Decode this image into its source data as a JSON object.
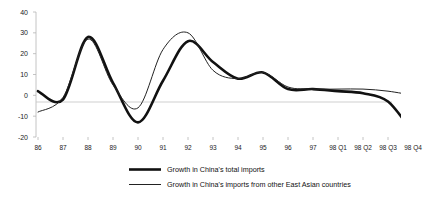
{
  "chart_data": {
    "type": "line",
    "title": "",
    "subtitle": "",
    "xlabel": "",
    "ylabel": "",
    "grid": false,
    "zero_line": true,
    "legend_position": "bottom-center",
    "ylim": [
      -20,
      40
    ],
    "yticks": [
      -20,
      -10,
      0,
      10,
      20,
      30,
      40
    ],
    "ytick_labels": [
      "-20",
      "-10",
      "0",
      "10",
      "20",
      "30",
      "40"
    ],
    "categories": [
      "86",
      "87",
      "88",
      "89",
      "90",
      "91",
      "92",
      "93",
      "94",
      "95",
      "96",
      "97",
      "98 Q1",
      "98 Q2",
      "98 Q3",
      "98 Q4"
    ],
    "series": [
      {
        "name": "Growth in China's total imports",
        "style": "thick",
        "color": "#111111",
        "width": 2.6,
        "values": [
          2,
          -2,
          28,
          6,
          -13,
          7,
          26,
          16,
          8,
          11,
          3,
          3,
          2,
          1,
          -3,
          -18
        ]
      },
      {
        "name": "Growth in China's imports from other East Asian countries",
        "style": "thin",
        "color": "#222222",
        "width": 1.0,
        "values": [
          -8,
          -1,
          27,
          5,
          -6,
          22,
          30,
          12,
          8,
          11,
          4,
          3,
          3,
          3,
          2,
          0
        ]
      }
    ]
  },
  "legend": {
    "items": [
      {
        "label": "Growth in China's total imports"
      },
      {
        "label": "Growth in China's imports from other East Asian countries"
      }
    ]
  }
}
